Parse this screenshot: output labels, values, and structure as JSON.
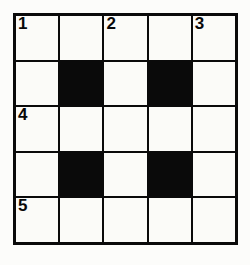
{
  "puzzle": {
    "title": "Crossword Grid",
    "type": "crossword",
    "rows": 5,
    "columns": 5,
    "colors": {
      "paper_background": "#fcfcfa",
      "cell_fill": "#fbfbf8",
      "block_fill": "#0a0a0a",
      "grid_line": "#0a0a0a",
      "number_text": "#080808"
    },
    "grid": [
      [
        {
          "state": "open",
          "number": "1"
        },
        {
          "state": "open",
          "number": ""
        },
        {
          "state": "open",
          "number": "2"
        },
        {
          "state": "open",
          "number": ""
        },
        {
          "state": "open",
          "number": "3"
        }
      ],
      [
        {
          "state": "open",
          "number": ""
        },
        {
          "state": "block",
          "number": ""
        },
        {
          "state": "open",
          "number": ""
        },
        {
          "state": "block",
          "number": ""
        },
        {
          "state": "open",
          "number": ""
        }
      ],
      [
        {
          "state": "open",
          "number": "4"
        },
        {
          "state": "open",
          "number": ""
        },
        {
          "state": "open",
          "number": ""
        },
        {
          "state": "open",
          "number": ""
        },
        {
          "state": "open",
          "number": ""
        }
      ],
      [
        {
          "state": "open",
          "number": ""
        },
        {
          "state": "block",
          "number": ""
        },
        {
          "state": "open",
          "number": ""
        },
        {
          "state": "block",
          "number": ""
        },
        {
          "state": "open",
          "number": ""
        }
      ],
      [
        {
          "state": "open",
          "number": "5"
        },
        {
          "state": "open",
          "number": ""
        },
        {
          "state": "open",
          "number": ""
        },
        {
          "state": "open",
          "number": ""
        },
        {
          "state": "open",
          "number": ""
        }
      ]
    ]
  }
}
